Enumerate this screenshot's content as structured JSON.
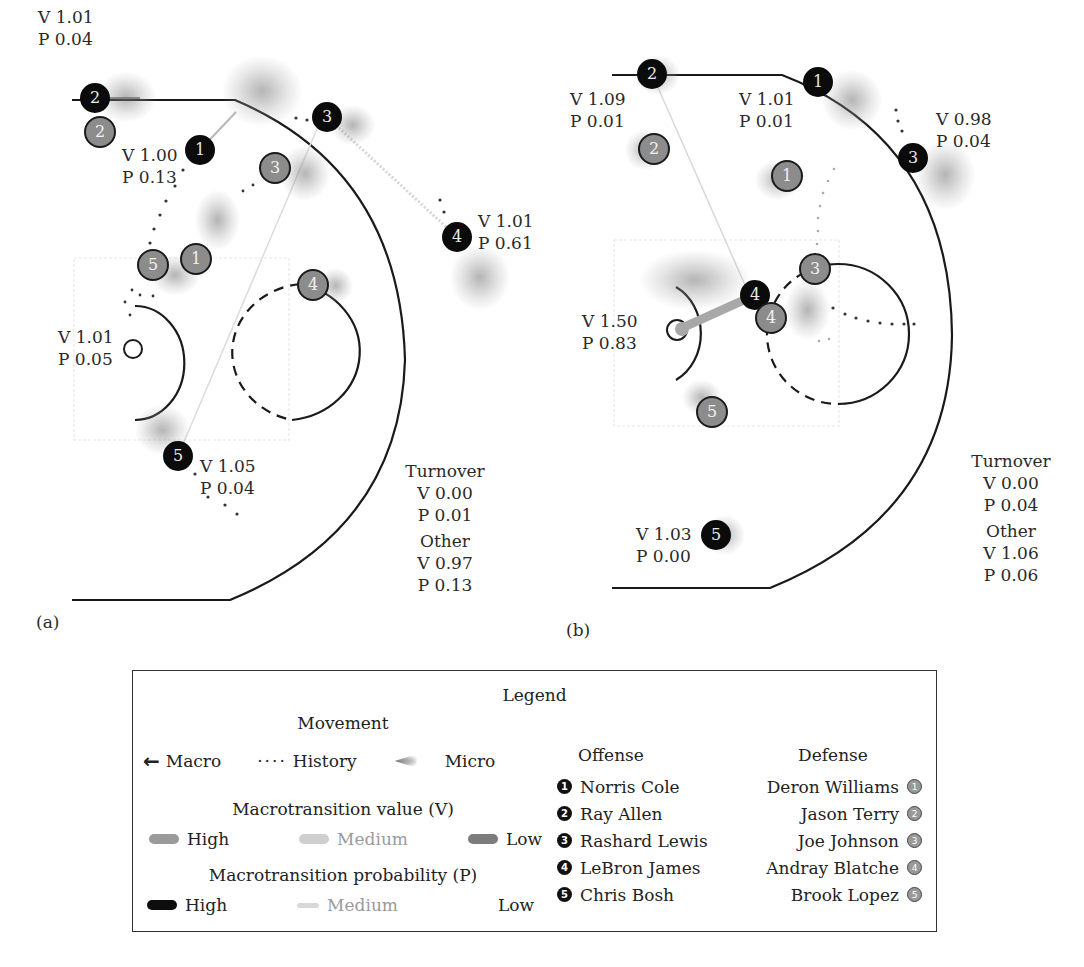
{
  "figure": {
    "panels": [
      {
        "id": "a",
        "tag": "(a)",
        "offense": [
          {
            "num": "1",
            "name": "Norris Cole",
            "x": 200,
            "y": 150,
            "label": {
              "V": "V 1.00",
              "P": "P 0.13"
            }
          },
          {
            "num": "2",
            "name": "Ray Allen",
            "x": 95,
            "y": 98,
            "label": {
              "V": "V 1.01",
              "P": "P 0.04"
            }
          },
          {
            "num": "3",
            "name": "Rashard Lewis",
            "x": 327,
            "y": 117,
            "label": null
          },
          {
            "num": "4",
            "name": "LeBron James",
            "x": 457,
            "y": 237,
            "label": {
              "V": "V 1.01",
              "P": "P 0.61"
            }
          },
          {
            "num": "5",
            "name": "Chris Bosh",
            "x": 178,
            "y": 456,
            "label": {
              "V": "V 1.05",
              "P": "P 0.04"
            }
          }
        ],
        "defense": [
          {
            "num": "1",
            "name": "Deron Williams",
            "x": 196,
            "y": 259
          },
          {
            "num": "2",
            "name": "Jason Terry",
            "x": 100,
            "y": 132
          },
          {
            "num": "3",
            "name": "Joe Johnson",
            "x": 275,
            "y": 168
          },
          {
            "num": "4",
            "name": "Andray Blatche",
            "x": 313,
            "y": 285
          },
          {
            "num": "5",
            "name": "Brook Lopez",
            "x": 153,
            "y": 265
          }
        ],
        "basket_label": {
          "V": "V 1.01",
          "P": "P 0.05"
        },
        "turnover": {
          "title": "Turnover",
          "V": "V 0.00",
          "P": "P 0.01"
        },
        "other": {
          "title": "Other",
          "V": "V 0.97",
          "P": "P 0.13"
        }
      },
      {
        "id": "b",
        "tag": "(b)",
        "offense": [
          {
            "num": "1",
            "name": "Norris Cole",
            "x": 818,
            "y": 82,
            "label": {
              "V": "V 1.01",
              "P": "P 0.01"
            }
          },
          {
            "num": "2",
            "name": "Ray Allen",
            "x": 652,
            "y": 74,
            "label": {
              "V": "V 1.09",
              "P": "P 0.01"
            }
          },
          {
            "num": "3",
            "name": "Rashard Lewis",
            "x": 913,
            "y": 158,
            "label": {
              "V": "V 0.98",
              "P": "P 0.04"
            }
          },
          {
            "num": "4",
            "name": "LeBron James",
            "x": 755,
            "y": 295,
            "label": {
              "V": "V 1.50",
              "P": "P 0.83"
            }
          },
          {
            "num": "5",
            "name": "Chris Bosh",
            "x": 716,
            "y": 535,
            "label": {
              "V": "V 1.03",
              "P": "P 0.00"
            }
          }
        ],
        "defense": [
          {
            "num": "1",
            "name": "Deron Williams",
            "x": 787,
            "y": 176
          },
          {
            "num": "2",
            "name": "Jason Terry",
            "x": 654,
            "y": 149
          },
          {
            "num": "3",
            "name": "Joe Johnson",
            "x": 815,
            "y": 269
          },
          {
            "num": "4",
            "name": "Andray Blatche",
            "x": 771,
            "y": 318
          },
          {
            "num": "5",
            "name": "Brook Lopez",
            "x": 712,
            "y": 412
          }
        ],
        "turnover": {
          "title": "Turnover",
          "V": "V 0.00",
          "P": "P 0.04"
        },
        "other": {
          "title": "Other",
          "V": "V 1.06",
          "P": "P 0.06"
        }
      }
    ]
  },
  "legend": {
    "title": "Legend",
    "movement": {
      "title": "Movement",
      "items": [
        {
          "icon": "arrow-left-icon",
          "label": "Macro"
        },
        {
          "icon": "dotted-line-icon",
          "label": "History"
        },
        {
          "icon": "micro-cone-icon",
          "label": "Micro"
        }
      ]
    },
    "value": {
      "title": "Macrotransition value (V)",
      "levels": [
        {
          "label": "High",
          "color": "#9a9a9a"
        },
        {
          "label": "Medium",
          "color": "#cfcfcf"
        },
        {
          "label": "Low",
          "color": "#7c7c7c"
        }
      ]
    },
    "probability": {
      "title": "Macrotransition probability (P)",
      "levels": [
        {
          "label": "High",
          "color": "#0d0d0d"
        },
        {
          "label": "Medium",
          "color": "#d8d8d8"
        },
        {
          "label": "Low",
          "color": "#ffffff"
        }
      ]
    },
    "offense": {
      "title": "Offense",
      "players": [
        {
          "num": "1",
          "name": "Norris Cole"
        },
        {
          "num": "2",
          "name": "Ray Allen"
        },
        {
          "num": "3",
          "name": "Rashard Lewis"
        },
        {
          "num": "4",
          "name": "LeBron James"
        },
        {
          "num": "5",
          "name": "Chris Bosh"
        }
      ]
    },
    "defense": {
      "title": "Defense",
      "players": [
        {
          "num": "1",
          "name": "Deron Williams"
        },
        {
          "num": "2",
          "name": "Jason Terry"
        },
        {
          "num": "3",
          "name": "Joe Johnson"
        },
        {
          "num": "4",
          "name": "Andray Blatche"
        },
        {
          "num": "5",
          "name": "Brook Lopez"
        }
      ]
    }
  },
  "colors": {
    "offense_fill": "#0b0b0b",
    "defense_fill": "#8c8c8c",
    "court_line": "#1a1a1a",
    "paint_box": "#e6e6e6"
  }
}
